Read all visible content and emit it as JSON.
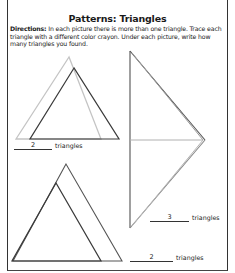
{
  "worksheet": {
    "title": "Patterns: Triangles",
    "directions_label": "Directions:",
    "directions_text": " In each picture there is more than one triangle. Trace each triangle with a different color crayon. Under each picture, write how many triangles you found."
  },
  "pictures": [
    {
      "id": "top-left",
      "answer": "2",
      "unit": "triangles"
    },
    {
      "id": "right",
      "answer": "3",
      "unit": "triangles"
    },
    {
      "id": "bottom-left",
      "answer": "2",
      "unit": "triangles"
    }
  ],
  "colors": {
    "ink": "#333333",
    "light_line": "#bdbdbd",
    "mid_line": "#8a8a8a"
  }
}
